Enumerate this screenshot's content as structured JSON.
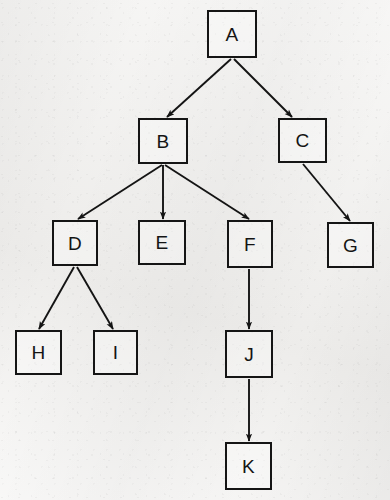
{
  "diagram": {
    "type": "tree",
    "title": "",
    "background_color": "#f2f1ef",
    "node_border_color": "#151515",
    "edge_color": "#141414",
    "node_shape": "square",
    "arrow_direction": "parent-to-child",
    "nodes": [
      {
        "id": "A",
        "label": "A",
        "x": 207,
        "y": 10,
        "w": 50,
        "h": 48,
        "level": 0
      },
      {
        "id": "B",
        "label": "B",
        "x": 138,
        "y": 118,
        "w": 50,
        "h": 46,
        "level": 1
      },
      {
        "id": "C",
        "label": "C",
        "x": 278,
        "y": 118,
        "w": 49,
        "h": 45,
        "level": 1
      },
      {
        "id": "D",
        "label": "D",
        "x": 52,
        "y": 220,
        "w": 46,
        "h": 46,
        "level": 2
      },
      {
        "id": "E",
        "label": "E",
        "x": 138,
        "y": 220,
        "w": 48,
        "h": 45,
        "level": 2
      },
      {
        "id": "F",
        "label": "F",
        "x": 227,
        "y": 220,
        "w": 46,
        "h": 48,
        "level": 2
      },
      {
        "id": "G",
        "label": "G",
        "x": 327,
        "y": 222,
        "w": 47,
        "h": 46,
        "level": 2
      },
      {
        "id": "H",
        "label": "H",
        "x": 15,
        "y": 330,
        "w": 47,
        "h": 45,
        "level": 3
      },
      {
        "id": "I",
        "label": "I",
        "x": 93,
        "y": 330,
        "w": 45,
        "h": 45,
        "level": 3
      },
      {
        "id": "J",
        "label": "J",
        "x": 225,
        "y": 330,
        "w": 48,
        "h": 48,
        "level": 3
      },
      {
        "id": "K",
        "label": "K",
        "x": 225,
        "y": 442,
        "w": 47,
        "h": 48,
        "level": 4
      }
    ],
    "edges": [
      {
        "from": "A",
        "to": "B",
        "x1": 231,
        "y1": 59,
        "x2": 167,
        "y2": 117
      },
      {
        "from": "A",
        "to": "C",
        "x1": 234,
        "y1": 59,
        "x2": 292,
        "y2": 117
      },
      {
        "from": "B",
        "to": "D",
        "x1": 162,
        "y1": 165,
        "x2": 78,
        "y2": 219
      },
      {
        "from": "B",
        "to": "E",
        "x1": 163,
        "y1": 165,
        "x2": 163,
        "y2": 219
      },
      {
        "from": "B",
        "to": "F",
        "x1": 165,
        "y1": 165,
        "x2": 249,
        "y2": 219
      },
      {
        "from": "C",
        "to": "G",
        "x1": 303,
        "y1": 164,
        "x2": 350,
        "y2": 221
      },
      {
        "from": "D",
        "to": "H",
        "x1": 74,
        "y1": 267,
        "x2": 39,
        "y2": 329
      },
      {
        "from": "D",
        "to": "I",
        "x1": 77,
        "y1": 267,
        "x2": 113,
        "y2": 329
      },
      {
        "from": "F",
        "to": "J",
        "x1": 249,
        "y1": 269,
        "x2": 249,
        "y2": 329
      },
      {
        "from": "J",
        "to": "K",
        "x1": 249,
        "y1": 379,
        "x2": 249,
        "y2": 441
      }
    ],
    "ghost_marks": [
      {
        "text": "",
        "x": 250,
        "y": 305
      },
      {
        "text": "",
        "x": 40,
        "y": 470
      }
    ]
  }
}
